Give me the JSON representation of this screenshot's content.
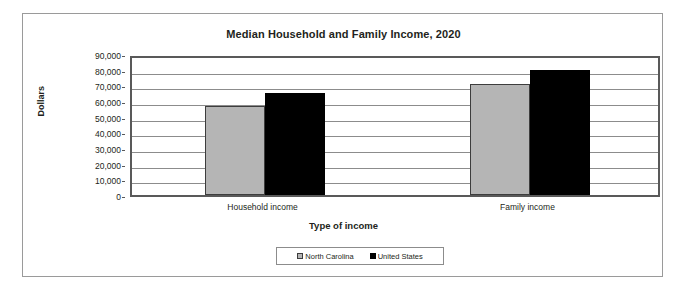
{
  "chart_data": {
    "type": "bar",
    "title": "Median Household and Family Income, 2020",
    "xlabel": "Type of income",
    "ylabel": "Dollars",
    "categories": [
      "Household income",
      "Family income"
    ],
    "series": [
      {
        "name": "North Carolina",
        "color": "#b5b5b5",
        "values": [
          56600,
          70600
        ]
      },
      {
        "name": "United States",
        "color": "#000000",
        "values": [
          64900,
          80000
        ]
      }
    ],
    "ylim": [
      0,
      90000
    ],
    "ytick_step": 10000,
    "ytick_labels": [
      "90,000",
      "80,000",
      "70,000",
      "60,000",
      "50,000",
      "40,000",
      "30,000",
      "20,000",
      "10,000",
      "0"
    ],
    "ytick_values": [
      90000,
      80000,
      70000,
      60000,
      50000,
      40000,
      30000,
      20000,
      10000,
      0
    ],
    "grid": true,
    "legend_position": "bottom",
    "legend_entries": [
      "North Carolina",
      "United States"
    ]
  }
}
